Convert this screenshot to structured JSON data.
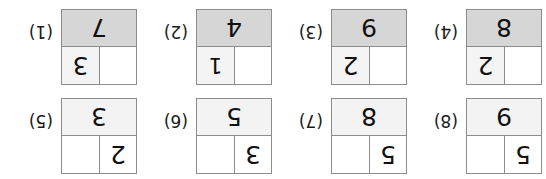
{
  "worksheet": {
    "orientation": "upside-down",
    "colors": {
      "border": "#8c8c8c",
      "shade_light": "#f3f3f3",
      "shade_dark": "#d6d6d6",
      "text": "#111111"
    },
    "rows": [
      {
        "name": "top-row",
        "problems": [
          {
            "number": "(8)",
            "digit_position": "left",
            "top_left": "5",
            "top_right": "",
            "bottom": "9",
            "bottom_shade": "light",
            "cell_shade": "none"
          },
          {
            "number": "(7)",
            "digit_position": "left",
            "top_left": "5",
            "top_right": "",
            "bottom": "8",
            "bottom_shade": "light",
            "cell_shade": "none"
          },
          {
            "number": "(6)",
            "digit_position": "left",
            "top_left": "3",
            "top_right": "",
            "bottom": "5",
            "bottom_shade": "light",
            "cell_shade": "none"
          },
          {
            "number": "(5)",
            "digit_position": "left",
            "top_left": "2",
            "top_right": "",
            "bottom": "3",
            "bottom_shade": "light",
            "cell_shade": "none"
          }
        ]
      },
      {
        "name": "bottom-row",
        "problems": [
          {
            "number": "(4)",
            "digit_position": "right",
            "top_left": "",
            "top_right": "2",
            "bottom": "8",
            "bottom_shade": "dark",
            "cell_shade": "light"
          },
          {
            "number": "(3)",
            "digit_position": "right",
            "top_left": "",
            "top_right": "2",
            "bottom": "9",
            "bottom_shade": "dark",
            "cell_shade": "light"
          },
          {
            "number": "(2)",
            "digit_position": "right",
            "top_left": "",
            "top_right": "1",
            "bottom": "4",
            "bottom_shade": "dark",
            "cell_shade": "light"
          },
          {
            "number": "(1)",
            "digit_position": "right",
            "top_left": "",
            "top_right": "3",
            "bottom": "7",
            "bottom_shade": "dark",
            "cell_shade": "light"
          }
        ]
      }
    ]
  }
}
